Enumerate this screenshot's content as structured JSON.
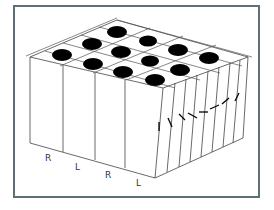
{
  "diagram": {
    "title": "",
    "colors": {
      "frame": "#5f6f78",
      "lines": "#444444",
      "blobs": "#000000",
      "background": "#ffffff"
    },
    "front_labels": [
      "R",
      "L",
      "R",
      "L"
    ],
    "blob_count": 13,
    "orientation_ticks": 9
  }
}
